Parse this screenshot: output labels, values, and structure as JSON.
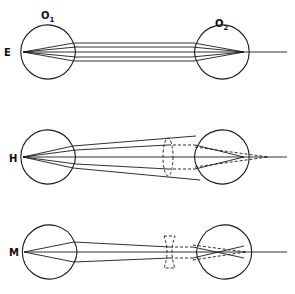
{
  "diagram": {
    "eye_labels": {
      "left": "O",
      "left_sub": "1",
      "right": "O",
      "right_sub": "2"
    },
    "rows": [
      {
        "id": "E",
        "label": "E",
        "meaning": "emmetropia",
        "lens": "none"
      },
      {
        "id": "H",
        "label": "H",
        "meaning": "hyperopia",
        "lens": "convex (dashed)"
      },
      {
        "id": "M",
        "label": "M",
        "meaning": "myopia",
        "lens": "concave (dashed)"
      }
    ],
    "colors": {
      "line": "#1a1a1a",
      "background": "#ffffff"
    }
  }
}
